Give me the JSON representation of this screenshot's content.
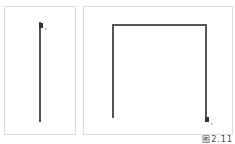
{
  "figure": {
    "caption": "图2.11",
    "stroke_color": "#555555",
    "panels": [
      {
        "id": "left",
        "description": "single vertical stroke drawn downward from top",
        "path": [
          [
            35,
            15
          ],
          [
            35,
            115
          ]
        ],
        "cursor": [
          37,
          18
        ]
      },
      {
        "id": "right",
        "description": "inverted U stroke: up, across, down",
        "path": [
          [
            29,
            111
          ],
          [
            29,
            18
          ],
          [
            122,
            18
          ],
          [
            122,
            112
          ]
        ],
        "cursor": [
          123,
          114
        ]
      }
    ]
  }
}
